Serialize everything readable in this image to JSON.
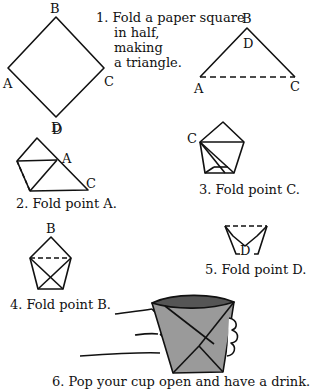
{
  "steps": [
    {
      "number": "1.",
      "lines": [
        "Fold a paper square",
        "in half,",
        "making",
        "a triangle."
      ]
    },
    {
      "number": "2.",
      "caption": "2.  Fold point A."
    },
    {
      "number": "3.",
      "caption": "3.  Fold point C."
    },
    {
      "number": "4.",
      "caption": "4.  Fold point B."
    },
    {
      "number": "5.",
      "caption": "5.  Fold point D."
    },
    {
      "number": "6.",
      "caption": "6.  Pop your cup open and have a drink."
    }
  ],
  "labels": {
    "square": {
      "top": "B",
      "left": "A",
      "right": "C",
      "bottom": "D"
    },
    "triangle": {
      "top": "B",
      "inner": "D",
      "left": "A",
      "right": "C"
    },
    "step2": {
      "top": "D",
      "mid": "A",
      "right": "C"
    },
    "step3": {
      "left": "C"
    },
    "step4": {
      "top": "B"
    },
    "step5": {
      "bottom": "D"
    }
  },
  "colors": {
    "line": "#111111",
    "cup_fill": "#9a9a9a",
    "cup_top": "#555555",
    "background": "#ffffff"
  }
}
